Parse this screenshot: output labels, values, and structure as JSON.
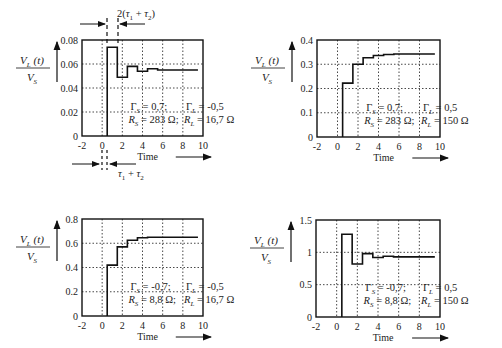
{
  "chart_data": [
    {
      "type": "line",
      "step": true,
      "panel": "top-left",
      "title": "",
      "xlabel": "Time",
      "ylabel": "V_L(t) / V_S",
      "xlim": [
        -2,
        10
      ],
      "ylim": [
        0,
        0.08
      ],
      "xticks": [
        -2,
        0,
        2,
        4,
        6,
        8,
        10
      ],
      "yticks": [
        0,
        0.02,
        0.04,
        0.06,
        0.08
      ],
      "ytick_labels": [
        "0",
        "0.02",
        "0.04",
        "0.06",
        "0.08"
      ],
      "grid": true,
      "params": {
        "gamma_s": "Γ_S = 0,7;",
        "r_s": "R_S = 283 Ω;",
        "gamma_l": "Γ_L = -0,5",
        "r_l": "R_L = 16,7 Ω"
      },
      "x": [
        0.5,
        1.5,
        1.5,
        2.5,
        2.5,
        3.5,
        3.5,
        4.5,
        4.5,
        5.5,
        5.5,
        9.5
      ],
      "y": [
        0.074,
        0.074,
        0.049,
        0.049,
        0.058,
        0.058,
        0.054,
        0.054,
        0.056,
        0.056,
        0.055,
        0.055
      ],
      "annotations": [
        "2(τ1 + τ2)",
        "τ1 + τ2"
      ]
    },
    {
      "type": "line",
      "step": true,
      "panel": "top-right",
      "xlabel": "Time",
      "ylabel": "V_L(t) / V_S",
      "xlim": [
        -2,
        10
      ],
      "ylim": [
        0,
        0.4
      ],
      "xticks": [
        -2,
        0,
        2,
        4,
        6,
        8,
        10
      ],
      "yticks": [
        0,
        0.1,
        0.2,
        0.3,
        0.4
      ],
      "ytick_labels": [
        "0",
        "0.1",
        "0.2",
        "0.3",
        "0.4"
      ],
      "grid": true,
      "params": {
        "gamma_s": "Γ_S = 0,7;",
        "r_s": "R_S = 283 Ω;",
        "gamma_l": "Γ_L = 0,5",
        "r_l": "R_L = 150 Ω"
      },
      "x": [
        0.5,
        1.5,
        1.5,
        2.5,
        2.5,
        3.5,
        3.5,
        4.5,
        4.5,
        5.5,
        5.5,
        9.5
      ],
      "y": [
        0.222,
        0.222,
        0.3,
        0.3,
        0.327,
        0.327,
        0.336,
        0.336,
        0.34,
        0.34,
        0.342,
        0.342
      ]
    },
    {
      "type": "line",
      "step": true,
      "panel": "bottom-left",
      "xlabel": "Time",
      "ylabel": "V_L(t) / V_S",
      "xlim": [
        -2,
        10
      ],
      "ylim": [
        0,
        0.8
      ],
      "xticks": [
        -2,
        0,
        2,
        4,
        6,
        8,
        10
      ],
      "yticks": [
        0,
        0.2,
        0.4,
        0.6,
        0.8
      ],
      "ytick_labels": [
        "0",
        "0.2",
        "0.4",
        "0.6",
        "0.8"
      ],
      "grid": true,
      "params": {
        "gamma_s": "Γ_S = -0,7;",
        "r_s": "R_S = 8,8 Ω;",
        "gamma_l": "Γ_L = -0,5",
        "r_l": "R_L = 16,7 Ω"
      },
      "x": [
        0.5,
        1.5,
        1.5,
        2.5,
        2.5,
        3.5,
        3.5,
        4.5,
        4.5,
        9.5
      ],
      "y": [
        0.42,
        0.42,
        0.57,
        0.57,
        0.625,
        0.625,
        0.645,
        0.645,
        0.65,
        0.65
      ]
    },
    {
      "type": "line",
      "step": true,
      "panel": "bottom-right",
      "xlabel": "Time",
      "ylabel": "V_L(t) / V_S",
      "xlim": [
        -2,
        10
      ],
      "ylim": [
        0,
        1.5
      ],
      "xticks": [
        -2,
        0,
        2,
        4,
        6,
        8,
        10
      ],
      "yticks": [
        0,
        0.5,
        1,
        1.5
      ],
      "ytick_labels": [
        "0",
        "0.5",
        "1",
        "1.5"
      ],
      "grid": true,
      "params": {
        "gamma_s": "Γ_S = -0,7;",
        "r_s": "R_S = 8,8 Ω;",
        "gamma_l": "Γ_L = 0,5",
        "r_l": "R_L = 150 Ω"
      },
      "x": [
        0.5,
        1.5,
        1.5,
        2.5,
        2.5,
        3.5,
        3.5,
        4.5,
        4.5,
        5.5,
        5.5,
        9.5
      ],
      "y": [
        1.28,
        1.28,
        0.82,
        0.82,
        0.98,
        0.98,
        0.92,
        0.92,
        0.94,
        0.94,
        0.93,
        0.93
      ]
    }
  ],
  "labels": {
    "time": "Time",
    "ylabel_num": "V",
    "ylabel_num_sub": "L",
    "ylabel_num_arg": "(t)",
    "ylabel_den": "V",
    "ylabel_den_sub": "S",
    "anno_top": "2(τ",
    "anno_bottom": "τ"
  },
  "panels_layout": [
    {
      "left": 82,
      "top": 40,
      "right": 203,
      "bottom": 136
    },
    {
      "left": 317,
      "top": 40,
      "right": 440,
      "bottom": 137
    },
    {
      "left": 82,
      "top": 219,
      "right": 203,
      "bottom": 316
    },
    {
      "left": 316,
      "top": 220,
      "right": 440,
      "bottom": 317
    }
  ]
}
